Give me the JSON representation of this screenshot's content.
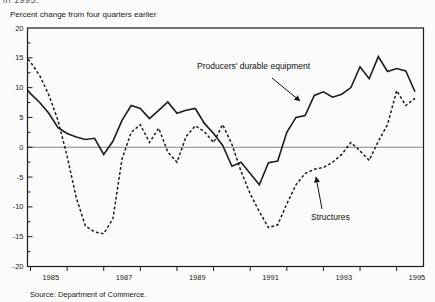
{
  "page": {
    "top_fragment": "in 1995.",
    "source": "Source: Department of Commerce."
  },
  "chart_data": {
    "type": "line",
    "title": "Percent change from four quarters earlier",
    "ylabel": "Percent change from four quarters earlier",
    "x_start": 1984.75,
    "x_step": 0.25,
    "x_first_period": "1984Q4",
    "x_last_period": "1995Q3",
    "xlim": [
      1984.92,
      1995.73
    ],
    "ylim": [
      -20,
      20
    ],
    "yticks": [
      20,
      15,
      10,
      5,
      0,
      -5,
      -10,
      -15,
      -20
    ],
    "ytick_minor_step": 2.5,
    "xtick_years": [
      1985,
      1986,
      1987,
      1988,
      1989,
      1990,
      1991,
      1992,
      1993,
      1994,
      1995
    ],
    "xtick_labels": [
      "1985",
      "1987",
      "1989",
      "1991",
      "1993",
      "1995"
    ],
    "xtick_label_years": [
      1985,
      1987,
      1989,
      1991,
      1993,
      1995
    ],
    "zero_line": true,
    "grid": false,
    "legend_position": "in-plot annotations with arrows",
    "line_color": "#1c1c1c",
    "background_color": "#fbfbf9",
    "series": [
      {
        "name": "Producers' durable equipment",
        "style": "solid",
        "values": [
          10.8,
          9.0,
          7.5,
          5.7,
          3.3,
          2.3,
          1.7,
          1.3,
          1.5,
          -1.2,
          1.0,
          4.5,
          7.0,
          6.5,
          4.8,
          6.2,
          7.6,
          5.7,
          6.2,
          6.5,
          4.0,
          2.3,
          0.3,
          -3.2,
          -2.5,
          -4.4,
          -6.3,
          -2.6,
          -2.3,
          2.5,
          5.0,
          5.3,
          8.7,
          9.3,
          8.4,
          8.9,
          10.0,
          13.5,
          11.5,
          15.2,
          12.7,
          13.2,
          12.8,
          9.3
        ]
      },
      {
        "name": "Structures",
        "style": "dashed",
        "values": [
          16.0,
          14.3,
          12.0,
          8.8,
          4.5,
          -1.5,
          -8.5,
          -13.2,
          -14.2,
          -14.5,
          -12.0,
          -2.0,
          2.5,
          3.8,
          0.8,
          3.2,
          -0.8,
          -2.5,
          1.8,
          3.6,
          2.6,
          0.8,
          3.8,
          0.5,
          -4.0,
          -7.8,
          -10.8,
          -13.5,
          -13.0,
          -9.5,
          -6.3,
          -4.4,
          -3.7,
          -3.4,
          -2.5,
          -1.2,
          0.8,
          -0.6,
          -2.2,
          1.0,
          3.8,
          9.5,
          7.0,
          8.2
        ]
      }
    ],
    "annotations": [
      {
        "text": "Producers' durable equipment",
        "arrow": {
          "x1": 272,
          "y1": 78,
          "x2": 300,
          "y2": 101
        }
      },
      {
        "text": "Structures",
        "arrow": {
          "x1": 322,
          "y1": 209,
          "x2": 316,
          "y2": 177
        }
      }
    ]
  }
}
